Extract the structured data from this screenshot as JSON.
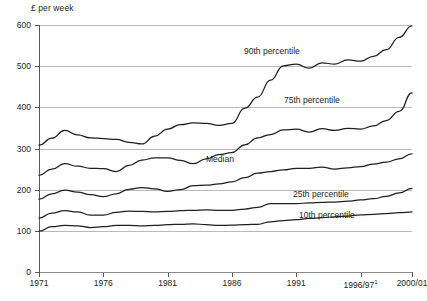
{
  "chart_data": {
    "type": "line",
    "title": "",
    "ylabel": "£ per week",
    "xlabel": "",
    "ylim": [
      0,
      600
    ],
    "yticks": [
      0,
      100,
      200,
      300,
      400,
      500,
      600
    ],
    "ytick_labels": [
      "0",
      "100",
      "200",
      "300",
      "400",
      "500",
      "600"
    ],
    "grid": true,
    "legend_position": "inline-labels",
    "xtick_labels": [
      "1971",
      "1976",
      "1981",
      "1986",
      "1991",
      "1996/97",
      "2000/01"
    ],
    "xtick_superscripts": [
      "",
      "",
      "",
      "",
      "",
      "1",
      ""
    ],
    "x": [
      1971,
      1972,
      1973,
      1974,
      1975,
      1976,
      1977,
      1978,
      1979,
      1980,
      1981,
      1982,
      1983,
      1984,
      1985,
      1986,
      1987,
      1988,
      1989,
      1990,
      1991,
      1992,
      1993,
      1994,
      1995,
      1996,
      1997,
      1998,
      1999,
      2000
    ],
    "series": [
      {
        "name": "90th percentile",
        "label": "90th percentile",
        "values": [
          308,
          325,
          344,
          333,
          326,
          324,
          322,
          315,
          311,
          330,
          347,
          358,
          362,
          361,
          356,
          361,
          398,
          425,
          466,
          501,
          505,
          495,
          508,
          505,
          515,
          512,
          524,
          540,
          570,
          598
        ]
      },
      {
        "name": "75th percentile",
        "label": "75th percentile",
        "values": [
          235,
          250,
          263,
          257,
          252,
          251,
          244,
          259,
          272,
          277,
          277,
          271,
          263,
          275,
          285,
          290,
          309,
          326,
          334,
          345,
          347,
          340,
          348,
          344,
          349,
          347,
          355,
          368,
          390,
          435
        ]
      },
      {
        "name": "Median",
        "label": "Median",
        "values": [
          177,
          190,
          199,
          194,
          188,
          183,
          190,
          201,
          205,
          202,
          196,
          200,
          210,
          211,
          214,
          219,
          229,
          240,
          244,
          248,
          252,
          252,
          255,
          250,
          253,
          256,
          262,
          267,
          275,
          287
        ]
      },
      {
        "name": "25th percentile",
        "label": "25th percentile",
        "values": [
          131,
          143,
          149,
          146,
          138,
          138,
          145,
          148,
          147,
          146,
          147,
          149,
          150,
          151,
          150,
          150,
          153,
          157,
          166,
          166,
          166,
          168,
          169,
          170,
          172,
          175,
          178,
          184,
          192,
          203
        ]
      },
      {
        "name": "10th percentile",
        "label": "10th percentile",
        "values": [
          99,
          110,
          113,
          112,
          108,
          110,
          113,
          113,
          112,
          113,
          115,
          116,
          117,
          115,
          113,
          114,
          115,
          116,
          122,
          125,
          127,
          130,
          132,
          134,
          136,
          139,
          140,
          142,
          144,
          146
        ]
      }
    ],
    "series_label_positions": [
      {
        "name": "90th percentile",
        "x": 244,
        "y": 47
      },
      {
        "name": "75th percentile",
        "x": 284,
        "y": 96
      },
      {
        "name": "Median",
        "x": 206,
        "y": 155
      },
      {
        "name": "25th percentile",
        "x": 293,
        "y": 190
      },
      {
        "name": "10th percentile",
        "x": 299,
        "y": 211
      }
    ],
    "colors": {
      "line": "#231f20",
      "grid": "#b9b9b9",
      "axis": "#58595b",
      "background": "#ffffff"
    }
  },
  "footnote": ""
}
